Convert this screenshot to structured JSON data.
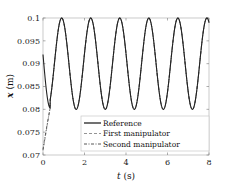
{
  "chart_data": {
    "type": "line",
    "title": "",
    "xlabel": "t (s)",
    "ylabel": "x (m)",
    "xlim": [
      0,
      8
    ],
    "ylim": [
      0.07,
      0.1
    ],
    "xticks": [
      0,
      2,
      4,
      6,
      8
    ],
    "xtick_labels": [
      "0",
      "2",
      "4",
      "6",
      "8"
    ],
    "yticks": [
      0.07,
      0.075,
      0.08,
      0.085,
      0.09,
      0.095,
      0.1
    ],
    "ytick_labels": [
      "0.07",
      "0.075",
      "0.08",
      "0.085",
      "0.09",
      "0.095",
      "0.1"
    ],
    "grid": false,
    "legend_position": "lower right",
    "series": [
      {
        "name": "Reference",
        "style": "solid",
        "color": "#000000",
        "description": "Sinusoid between 0.08 and 0.1 with period ~1.4 s, starting at ~0.092 at t=0",
        "amplitude": 0.01,
        "offset": 0.09,
        "period": 1.4,
        "x": [
          0,
          0.2,
          0.35,
          0.55,
          0.9,
          1.25,
          1.6,
          1.95,
          2.3,
          2.65,
          3.0,
          3.35,
          3.7,
          4.05,
          4.4,
          4.75,
          5.1,
          5.45,
          5.8,
          6.15,
          6.5,
          6.85,
          7.2,
          7.55,
          7.9,
          8.0
        ],
        "values": [
          0.092,
          0.084,
          0.08,
          0.083,
          0.1,
          0.09,
          0.08,
          0.09,
          0.1,
          0.09,
          0.08,
          0.09,
          0.1,
          0.09,
          0.08,
          0.09,
          0.1,
          0.09,
          0.08,
          0.09,
          0.1,
          0.09,
          0.08,
          0.09,
          0.1,
          0.0998
        ]
      },
      {
        "name": "First manipulator",
        "style": "dashed",
        "color": "#888888",
        "description": "Starts ~0.071 at t=0, converges to reference by ~0.35 s",
        "x": [
          0,
          0.1,
          0.2,
          0.3,
          0.35,
          0.55,
          0.9,
          1.25,
          1.6,
          1.95,
          2.3,
          2.65,
          3.0,
          3.35,
          3.7,
          4.05,
          4.4,
          4.75,
          5.1,
          5.45,
          5.8,
          6.15,
          6.5,
          6.85,
          7.2,
          7.55,
          7.9,
          8.0
        ],
        "values": [
          0.071,
          0.074,
          0.077,
          0.0795,
          0.0805,
          0.083,
          0.1,
          0.09,
          0.08,
          0.09,
          0.1,
          0.09,
          0.08,
          0.09,
          0.1,
          0.09,
          0.08,
          0.09,
          0.1,
          0.09,
          0.08,
          0.09,
          0.1,
          0.09,
          0.08,
          0.09,
          0.1,
          0.0998
        ]
      },
      {
        "name": "Second manipulator",
        "style": "dashdot",
        "color": "#444444",
        "description": "Starts ~0.071 at t=0, converges to reference by ~0.35 s",
        "x": [
          0,
          0.1,
          0.2,
          0.3,
          0.35,
          0.55,
          0.9,
          1.25,
          1.6,
          1.95,
          2.3,
          2.65,
          3.0,
          3.35,
          3.7,
          4.05,
          4.4,
          4.75,
          5.1,
          5.45,
          5.8,
          6.15,
          6.5,
          6.85,
          7.2,
          7.55,
          7.9,
          8.0
        ],
        "values": [
          0.071,
          0.0745,
          0.0775,
          0.0798,
          0.0805,
          0.083,
          0.1,
          0.09,
          0.08,
          0.09,
          0.1,
          0.09,
          0.08,
          0.09,
          0.1,
          0.09,
          0.08,
          0.09,
          0.1,
          0.09,
          0.08,
          0.09,
          0.1,
          0.09,
          0.08,
          0.09,
          0.1,
          0.0998
        ]
      }
    ]
  },
  "legend": {
    "items": [
      {
        "label": "Reference",
        "style": "solid"
      },
      {
        "label": "First manipulator",
        "style": "dashed"
      },
      {
        "label": "Second manipulator",
        "style": "dashdot"
      }
    ]
  },
  "axes": {
    "xlabel_var": "t",
    "xlabel_unit": "(s)",
    "ylabel_var": "x",
    "ylabel_unit": "(m)"
  }
}
